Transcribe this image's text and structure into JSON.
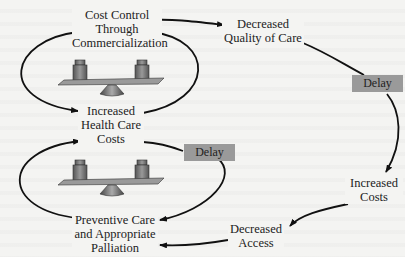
{
  "diagram": {
    "type": "causal-loop",
    "nodes": {
      "cost_control": {
        "line1": "Cost Control",
        "line2": "Through",
        "line3": "Commercialization"
      },
      "decreased_quality": {
        "line1": "Decreased",
        "line2": "Quality of Care"
      },
      "increased_hc_costs": {
        "line1": "Increased",
        "line2": "Health Care",
        "line3": "Costs"
      },
      "increased_costs": {
        "line1": "Increased",
        "line2": "Costs"
      },
      "decreased_access": {
        "line1": "Decreased",
        "line2": "Access"
      },
      "preventive_care": {
        "line1": "Preventive Care",
        "line2": "and Appropriate",
        "line3": "Palliation"
      }
    },
    "delays": {
      "upper": "Delay",
      "lower": "Delay"
    },
    "icons": {
      "upper_balance": "balance-scale-icon",
      "lower_balance": "balance-scale-icon"
    },
    "colors": {
      "delay_box": "#9a9a9a",
      "arrow": "#111111",
      "background": "#f4f4f2"
    }
  }
}
